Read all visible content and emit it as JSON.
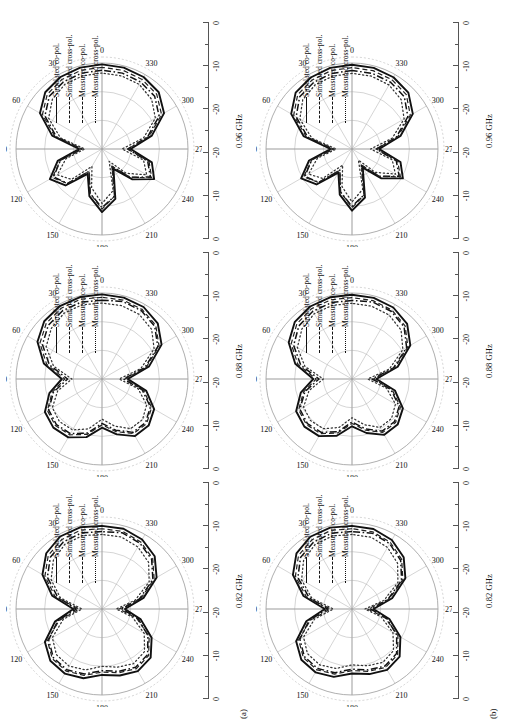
{
  "figure": {
    "rows": [
      {
        "id": "a",
        "label": "(a)"
      },
      {
        "id": "b",
        "label": "(b)"
      }
    ],
    "columns": [
      {
        "freq": "0.82 GHz"
      },
      {
        "freq": "0.88 GHz"
      },
      {
        "freq": "0.96 GHz"
      }
    ],
    "legend": [
      {
        "label": "Simulated co-pol.",
        "style": "solid"
      },
      {
        "label": "Simulated cross-pol.",
        "style": "dash-dot"
      },
      {
        "label": "Measured co-pol.",
        "style": "dashed"
      },
      {
        "label": "Measured cross-pol.",
        "style": "dotted"
      }
    ],
    "angular_labels": [
      "0",
      "30",
      "60",
      "90",
      "120",
      "150",
      "180",
      "210",
      "240",
      "270",
      "300",
      "330"
    ],
    "radial_labels": [
      "0",
      "-10",
      "-20",
      "-20",
      "-10",
      "0"
    ],
    "radial_unit": "dB"
  },
  "chart_data": {
    "type": "line",
    "subtype": "polar radiation pattern",
    "title": "",
    "xlabel": "",
    "ylabel": "",
    "theta_unit": "degrees",
    "r_unit": "dB",
    "rlim": [
      -30,
      0
    ],
    "r_ticks": [
      0,
      -10,
      -20,
      -30
    ],
    "theta_ticks": [
      0,
      30,
      60,
      90,
      120,
      150,
      180,
      210,
      240,
      270,
      300,
      330
    ],
    "grid": true,
    "legend_position": "inside-right",
    "series_names": [
      "Simulated co-pol.",
      "Simulated cross-pol.",
      "Measured co-pol.",
      "Measured cross-pol."
    ],
    "panels": [
      {
        "row": "(a)",
        "frequency": "0.82 GHz",
        "theta": [
          0,
          15,
          30,
          45,
          60,
          75,
          90,
          105,
          120,
          135,
          150,
          165,
          180,
          195,
          210,
          225,
          240,
          255,
          270,
          285,
          300,
          315,
          330,
          345
        ],
        "series": [
          {
            "name": "Simulated co-pol.",
            "values": [
              -1,
              -0.5,
              -0.8,
              -2.5,
              -6,
              -12,
              -20,
              -13,
              -7,
              -4.5,
              -4,
              -5,
              -7,
              -6,
              -5,
              -6,
              -10,
              -16,
              -22,
              -15,
              -8,
              -4,
              -2,
              -1
            ]
          },
          {
            "name": "Simulated cross-pol.",
            "values": [
              -3,
              -2.5,
              -3,
              -4.5,
              -8,
              -14,
              -21,
              -14,
              -8.5,
              -6,
              -5.5,
              -6.5,
              -8.5,
              -7.5,
              -6.5,
              -7.5,
              -11.5,
              -17,
              -23,
              -16.5,
              -9.5,
              -5.5,
              -3.5,
              -2.5
            ]
          },
          {
            "name": "Measured co-pol.",
            "values": [
              -2,
              -1.5,
              -2,
              -3.5,
              -7,
              -13,
              -22,
              -14.5,
              -8,
              -5.5,
              -5,
              -6,
              -8,
              -7,
              -6,
              -7,
              -11,
              -17.5,
              -24,
              -16,
              -9,
              -5,
              -3,
              -2
            ]
          },
          {
            "name": "Measured cross-pol.",
            "values": [
              -4,
              -3.5,
              -4,
              -6,
              -9.5,
              -15,
              -23,
              -16,
              -10,
              -7.5,
              -7,
              -8,
              -10,
              -9,
              -8,
              -9,
              -13,
              -19,
              -25,
              -18,
              -11,
              -7,
              -5,
              -4
            ]
          }
        ]
      },
      {
        "row": "(a)",
        "frequency": "0.88 GHz",
        "theta": [
          0,
          15,
          30,
          45,
          60,
          75,
          90,
          105,
          120,
          135,
          150,
          165,
          180,
          195,
          210,
          225,
          240,
          255,
          270,
          285,
          300,
          315,
          330,
          345
        ],
        "series": [
          {
            "name": "Simulated co-pol.",
            "values": [
              -0.5,
              -0.4,
              -0.6,
              -1.5,
              -4,
              -9,
              -16,
              -11,
              -7,
              -6,
              -6.5,
              -9,
              -13,
              -10,
              -7,
              -7,
              -9,
              -14,
              -21,
              -13,
              -6,
              -2.5,
              -1,
              -0.6
            ]
          },
          {
            "name": "Simulated cross-pol.",
            "values": [
              -2.5,
              -2.2,
              -2.5,
              -3.5,
              -6,
              -11,
              -18,
              -12.5,
              -8.5,
              -7.5,
              -8,
              -10.5,
              -14.5,
              -11.5,
              -8.5,
              -8.5,
              -10.5,
              -15.5,
              -22.5,
              -14.5,
              -7.5,
              -4,
              -2.5,
              -2
            ]
          },
          {
            "name": "Measured co-pol.",
            "values": [
              -1.5,
              -1.2,
              -1.5,
              -2.5,
              -5,
              -10,
              -17,
              -12,
              -8,
              -7,
              -7.5,
              -10,
              -14,
              -11,
              -8,
              -8,
              -10,
              -15,
              -22,
              -14,
              -7,
              -3.5,
              -2,
              -1.5
            ]
          },
          {
            "name": "Measured cross-pol.",
            "values": [
              -3.5,
              -3.2,
              -3.5,
              -5,
              -7.5,
              -12.5,
              -19.5,
              -14,
              -10,
              -9,
              -9.5,
              -12,
              -16,
              -13,
              -10,
              -10,
              -12,
              -17,
              -24,
              -16,
              -9,
              -5.5,
              -4,
              -3.5
            ]
          }
        ]
      },
      {
        "row": "(a)",
        "frequency": "0.96 GHz",
        "theta": [
          0,
          15,
          30,
          45,
          60,
          75,
          90,
          105,
          120,
          135,
          150,
          165,
          180,
          195,
          210,
          225,
          240,
          255,
          270,
          285,
          300,
          315,
          330,
          345
        ],
        "series": [
          {
            "name": "Simulated co-pol.",
            "values": [
              -0.5,
              -0.6,
              -1,
              -2,
              -5,
              -12,
              -22,
              -14,
              -9,
              -12,
              -20,
              -13,
              -8,
              -12,
              -22,
              -15,
              -9,
              -12,
              -20,
              -12,
              -5,
              -2,
              -1,
              -0.6
            ]
          },
          {
            "name": "Simulated cross-pol.",
            "values": [
              -2.5,
              -2.6,
              -3,
              -4,
              -7,
              -13.5,
              -23,
              -15,
              -10.5,
              -13,
              -21,
              -14,
              -9.5,
              -13,
              -23,
              -16,
              -10.5,
              -13.5,
              -21,
              -13.5,
              -7,
              -4,
              -3,
              -2.6
            ]
          },
          {
            "name": "Measured co-pol.",
            "values": [
              -1.5,
              -1.6,
              -2,
              -3,
              -6,
              -13,
              -23,
              -15,
              -10,
              -13,
              -21,
              -14,
              -9,
              -13,
              -23,
              -16,
              -10,
              -13,
              -21,
              -13,
              -6,
              -3,
              -2,
              -1.6
            ]
          },
          {
            "name": "Measured cross-pol.",
            "values": [
              -3.5,
              -3.6,
              -4,
              -5.5,
              -8.5,
              -15,
              -24,
              -17,
              -12,
              -15,
              -23,
              -16,
              -11,
              -15,
              -25,
              -18,
              -12,
              -15,
              -23,
              -15,
              -8.5,
              -5.5,
              -4,
              -3.6
            ]
          }
        ]
      },
      {
        "row": "(b)",
        "frequency": "0.82 GHz",
        "theta": [
          0,
          15,
          30,
          45,
          60,
          75,
          90,
          105,
          120,
          135,
          150,
          165,
          180,
          195,
          210,
          225,
          240,
          255,
          270,
          285,
          300,
          315,
          330,
          345
        ],
        "series": [
          {
            "name": "Simulated co-pol.",
            "values": [
              -1,
              -0.6,
              -0.9,
              -2.6,
              -6.2,
              -12.5,
              -20.5,
              -13.5,
              -7.5,
              -5,
              -4.5,
              -5.5,
              -7.5,
              -6.5,
              -5.5,
              -6.5,
              -10.5,
              -16.5,
              -22.5,
              -15.5,
              -8.5,
              -4.5,
              -2.2,
              -1.1
            ]
          },
          {
            "name": "Simulated cross-pol.",
            "values": [
              -3,
              -2.6,
              -3.1,
              -4.6,
              -8.2,
              -14.5,
              -21.5,
              -14.5,
              -9,
              -6.5,
              -6,
              -7,
              -9,
              -8,
              -7,
              -8,
              -12,
              -17.5,
              -23.5,
              -17,
              -10,
              -6,
              -3.7,
              -2.6
            ]
          },
          {
            "name": "Measured co-pol.",
            "values": [
              -2,
              -1.6,
              -2.1,
              -3.6,
              -7.2,
              -13.5,
              -22.5,
              -15,
              -8.5,
              -6,
              -5.5,
              -6.5,
              -8.5,
              -7.5,
              -6.5,
              -7.5,
              -11.5,
              -18,
              -24.5,
              -16.5,
              -9.5,
              -5.5,
              -3.2,
              -2.1
            ]
          },
          {
            "name": "Measured cross-pol.",
            "values": [
              -4,
              -3.6,
              -4.1,
              -6.1,
              -9.7,
              -15.5,
              -23.5,
              -16.5,
              -10.5,
              -8,
              -7.5,
              -8.5,
              -10.5,
              -9.5,
              -8.5,
              -9.5,
              -13.5,
              -19.5,
              -25.5,
              -18.5,
              -11.5,
              -7.5,
              -5.2,
              -4.1
            ]
          }
        ]
      },
      {
        "row": "(b)",
        "frequency": "0.88 GHz",
        "theta": [
          0,
          15,
          30,
          45,
          60,
          75,
          90,
          105,
          120,
          135,
          150,
          165,
          180,
          195,
          210,
          225,
          240,
          255,
          270,
          285,
          300,
          315,
          330,
          345
        ],
        "series": [
          {
            "name": "Simulated co-pol.",
            "values": [
              -0.6,
              -0.5,
              -0.8,
              -1.8,
              -4.5,
              -9.5,
              -16.5,
              -11.5,
              -7.5,
              -6.5,
              -7,
              -9.5,
              -13.5,
              -10.5,
              -7.5,
              -7.5,
              -9.5,
              -14.5,
              -21.5,
              -13.5,
              -6.5,
              -2.8,
              -1.2,
              -0.7
            ]
          },
          {
            "name": "Simulated cross-pol.",
            "values": [
              -2.6,
              -2.4,
              -2.7,
              -3.8,
              -6.5,
              -11.5,
              -18.5,
              -13,
              -9,
              -8,
              -8.5,
              -11,
              -15,
              -12,
              -9,
              -9,
              -11,
              -16,
              -23,
              -15,
              -8,
              -4.3,
              -2.7,
              -2.2
            ]
          },
          {
            "name": "Measured co-pol.",
            "values": [
              -1.6,
              -1.4,
              -1.7,
              -2.8,
              -5.5,
              -10.5,
              -17.5,
              -12.5,
              -8.5,
              -7.5,
              -8,
              -10.5,
              -14.5,
              -11.5,
              -8.5,
              -8.5,
              -10.5,
              -15.5,
              -22.5,
              -14.5,
              -7.5,
              -3.8,
              -2.2,
              -1.7
            ]
          },
          {
            "name": "Measured cross-pol.",
            "values": [
              -3.6,
              -3.4,
              -3.7,
              -5.3,
              -8,
              -13,
              -20,
              -14.5,
              -10.5,
              -9.5,
              -10,
              -12.5,
              -16.5,
              -13.5,
              -10.5,
              -10.5,
              -12.5,
              -17.5,
              -24.5,
              -16.5,
              -9.5,
              -5.8,
              -4.2,
              -3.7
            ]
          }
        ]
      },
      {
        "row": "(b)",
        "frequency": "0.96 GHz",
        "theta": [
          0,
          15,
          30,
          45,
          60,
          75,
          90,
          105,
          120,
          135,
          150,
          165,
          180,
          195,
          210,
          225,
          240,
          255,
          270,
          285,
          300,
          315,
          330,
          345
        ],
        "series": [
          {
            "name": "Simulated co-pol.",
            "values": [
              -0.6,
              -0.7,
              -1.2,
              -2.2,
              -5.5,
              -12.5,
              -22.5,
              -14.5,
              -9.5,
              -12.5,
              -20.5,
              -13.5,
              -8.5,
              -12.5,
              -22.5,
              -15.5,
              -9.5,
              -12.5,
              -20.5,
              -12.5,
              -5.5,
              -2.2,
              -1.1,
              -0.7
            ]
          },
          {
            "name": "Simulated cross-pol.",
            "values": [
              -2.6,
              -2.7,
              -3.2,
              -4.2,
              -7.5,
              -14,
              -23.5,
              -15.5,
              -11,
              -13.5,
              -21.5,
              -14.5,
              -10,
              -13.5,
              -23.5,
              -16.5,
              -11,
              -14,
              -21.5,
              -14,
              -7.5,
              -4.2,
              -3.1,
              -2.7
            ]
          },
          {
            "name": "Measured co-pol.",
            "values": [
              -1.6,
              -1.7,
              -2.2,
              -3.2,
              -6.5,
              -13.5,
              -23.5,
              -15.5,
              -10.5,
              -13.5,
              -21.5,
              -14.5,
              -9.5,
              -13.5,
              -23.5,
              -16.5,
              -10.5,
              -13.5,
              -21.5,
              -13.5,
              -6.5,
              -3.2,
              -2.1,
              -1.7
            ]
          },
          {
            "name": "Measured cross-pol.",
            "values": [
              -3.6,
              -3.7,
              -4.2,
              -5.7,
              -9,
              -15.5,
              -24.5,
              -17.5,
              -12.5,
              -15.5,
              -23.5,
              -16.5,
              -11.5,
              -15.5,
              -25.5,
              -18.5,
              -12.5,
              -15.5,
              -23.5,
              -15.5,
              -9,
              -5.7,
              -4.2,
              -3.7
            ]
          }
        ]
      }
    ]
  }
}
